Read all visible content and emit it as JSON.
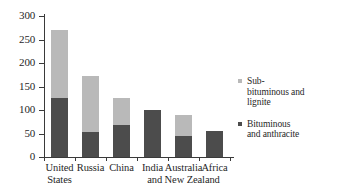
{
  "chart_data": {
    "type": "bar",
    "stacked": true,
    "title": "",
    "subtitle": "",
    "xlabel": "",
    "ylabel": "",
    "categories": [
      "United States",
      "Russia",
      "China",
      "India",
      "Australia and New Zealand",
      "Africa"
    ],
    "category_label_lines": [
      [
        "United",
        "States"
      ],
      [
        "Russia"
      ],
      [
        "China"
      ],
      [
        "India"
      ],
      [
        "Australia",
        "and New Zealand"
      ],
      [
        "Africa"
      ]
    ],
    "series": [
      {
        "name": "Bituminous and anthracite",
        "color": "#4c4c4c",
        "legend_lines": [
          "Bituminous",
          "and anthracite"
        ],
        "values": [
          125,
          53,
          68,
          100,
          45,
          56
        ]
      },
      {
        "name": "Sub-bituminous and lignite",
        "color": "#b9b9b9",
        "legend_lines": [
          "Sub-",
          "bituminous and",
          "lignite"
        ],
        "values": [
          145,
          119,
          58,
          0,
          44,
          0
        ]
      }
    ],
    "totals": [
      270,
      172,
      126,
      100,
      89,
      56
    ],
    "ylim": [
      0,
      300
    ],
    "yticks": [
      0,
      50,
      100,
      150,
      200,
      250,
      300
    ],
    "ytick_labels": [
      "0",
      "50",
      "100",
      "150",
      "200",
      "250",
      "300"
    ],
    "grid": false,
    "legend_position": "right"
  },
  "colors": {
    "light_gray": "#b9b9b9",
    "dark_gray": "#4c4c4c",
    "axis": "#3a3a3a",
    "text": "#1f1f1f",
    "background": "#ffffff"
  }
}
